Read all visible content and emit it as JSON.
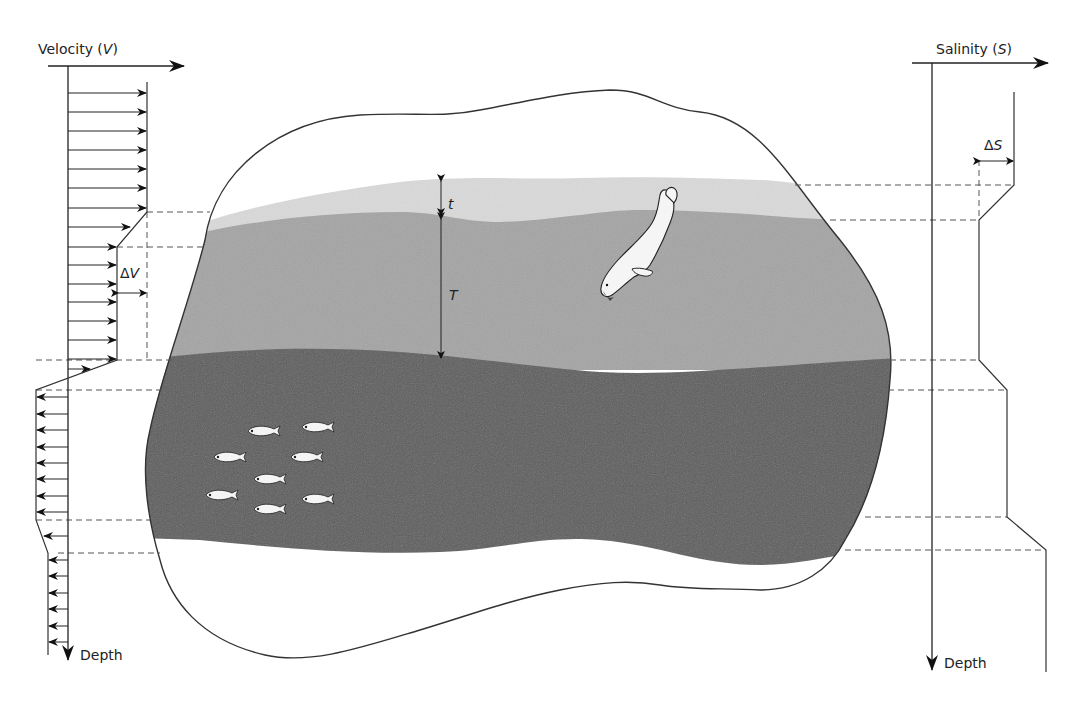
{
  "diagram": {
    "type": "ocean stratification cross-section with velocity and salinity profiles",
    "velocity_profile": {
      "axis_label": "Velocity (",
      "axis_symbol": "V",
      "axis_close": ")",
      "depth_label": "Depth",
      "delta_label": "ΔV",
      "delta_prefix": "Δ",
      "delta_symbol": "V"
    },
    "salinity_profile": {
      "axis_label": "Salinity (",
      "axis_symbol": "S",
      "axis_close": ")",
      "depth_label": "Depth",
      "delta_prefix": "Δ",
      "delta_symbol": "S"
    },
    "layers": {
      "thin_layer_label": "t",
      "thick_layer_label": "T"
    },
    "colors": {
      "surface_layer": "#d9d9d9",
      "middle_layer": "#a6a6a6",
      "deep_layer": "#5c5c5c",
      "outline": "#333333",
      "background": "#ffffff",
      "animal_fill": "#f4f4f4"
    },
    "figures": {
      "seal": "diving seal",
      "fish_count": 8
    }
  }
}
